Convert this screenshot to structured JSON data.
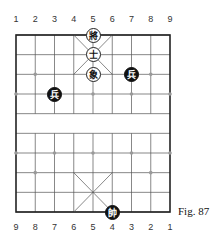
{
  "top_numbers": [
    "1",
    "2",
    "3",
    "4",
    "5",
    "6",
    "7",
    "8",
    "9"
  ],
  "bottom_numbers": [
    "9",
    "8",
    "7",
    "6",
    "5",
    "4",
    "3",
    "2",
    "1"
  ],
  "caption": "Fig. 87",
  "board": {
    "left": 16,
    "top": 35,
    "right": 170,
    "bottom": 212,
    "cols": 9,
    "rows": 10
  },
  "pieces": [
    {
      "char": "將",
      "style": "white",
      "col": 5,
      "row": 1,
      "label": "black-general"
    },
    {
      "char": "士",
      "style": "white",
      "col": 5,
      "row": 2,
      "label": "black-advisor"
    },
    {
      "char": "象",
      "style": "white",
      "col": 5,
      "row": 3,
      "label": "black-elephant"
    },
    {
      "char": "兵",
      "style": "black",
      "col": 7,
      "row": 3,
      "label": "red-soldier"
    },
    {
      "char": "兵",
      "style": "black",
      "col": 3,
      "row": 4,
      "label": "red-soldier"
    },
    {
      "char": "帥",
      "style": "black",
      "col": 6,
      "row": 10,
      "label": "red-general"
    }
  ]
}
